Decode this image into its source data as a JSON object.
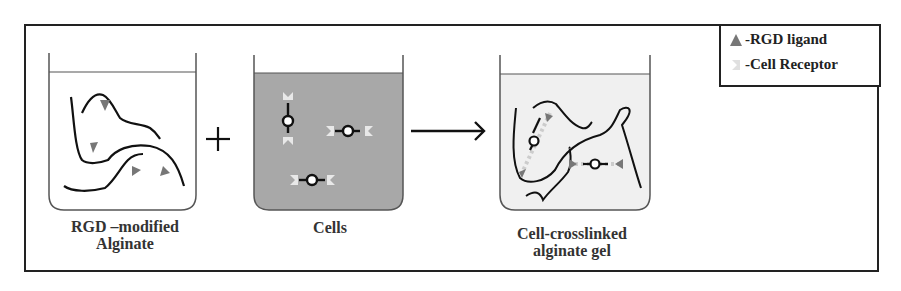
{
  "diagram": {
    "steps": [
      {
        "id": "rgd-alginate",
        "caption_line1": "RGD –modified",
        "caption_line2": "Alginate"
      },
      {
        "id": "cells",
        "caption_line1": "Cells",
        "caption_line2": ""
      },
      {
        "id": "crosslinked-gel",
        "caption_line1": "Cell-crosslinked",
        "caption_line2": "alginate gel"
      }
    ],
    "operators": {
      "plus": "+",
      "arrow": "→"
    },
    "legend": {
      "items": [
        {
          "symbol": "triangle",
          "label": "-RGD ligand",
          "color": "#777777"
        },
        {
          "symbol": "receptor",
          "label": "-Cell Receptor",
          "color": "#d8d8d8"
        }
      ]
    },
    "colors": {
      "frame": "#222222",
      "cells_medium": "#a8a8a8",
      "gel_medium": "#f0f0f0",
      "chain": "#111111",
      "ligand": "#777777",
      "receptor": "#e0e0e0"
    }
  }
}
